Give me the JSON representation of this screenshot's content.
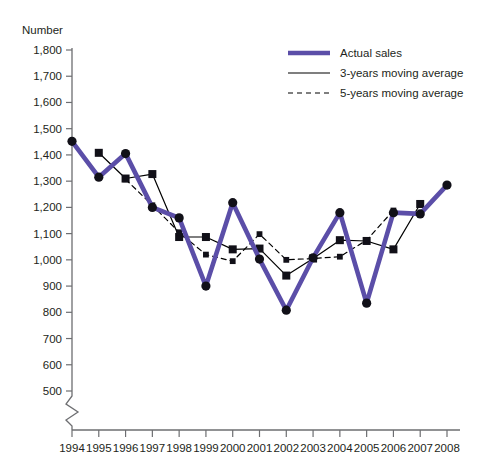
{
  "chart_data": {
    "type": "line",
    "title": "",
    "ylabel": "Number",
    "xlabel": "",
    "ylim": [
      500,
      1800
    ],
    "ytick_step": 100,
    "grid": false,
    "axis_break": true,
    "legend_position": "top-right",
    "categories": [
      "1994",
      "1995",
      "1996",
      "1997",
      "1998",
      "1999",
      "2000",
      "2001",
      "2002",
      "2003",
      "2004",
      "2005",
      "2006",
      "2007",
      "2008"
    ],
    "series": [
      {
        "name": "Actual sales",
        "color": "#5B4EA8",
        "style": "solid-thick",
        "marker": "circle",
        "values": [
          1452,
          1315,
          1405,
          1200,
          1160,
          900,
          1218,
          1003,
          808,
          1008,
          1180,
          835,
          1180,
          1175,
          1285
        ]
      },
      {
        "name": "3-years moving average",
        "color": "#000000",
        "style": "solid-thin",
        "marker": "square",
        "values": [
          null,
          1408,
          1310,
          1327,
          1087,
          1087,
          1040,
          1043,
          940,
          1005,
          1075,
          1072,
          1040,
          1213,
          null
        ]
      },
      {
        "name": "5-years moving average",
        "color": "#000000",
        "style": "dashed",
        "marker": "small-square",
        "values": [
          null,
          null,
          1307,
          1208,
          1105,
          1020,
          995,
          1098,
          1000,
          1005,
          1012,
          1075,
          1188,
          null,
          null
        ]
      }
    ],
    "ytick_labels": [
      "1,800",
      "1,700",
      "1,600",
      "1,500",
      "1,400",
      "1,300",
      "1,200",
      "1,100",
      "1,000",
      "900",
      "800",
      "700",
      "600",
      "500"
    ]
  },
  "legend": {
    "items": [
      {
        "label": "Actual sales"
      },
      {
        "label": "3-years moving average"
      },
      {
        "label": "5-years moving average"
      }
    ]
  },
  "caption": {
    "text": ""
  }
}
